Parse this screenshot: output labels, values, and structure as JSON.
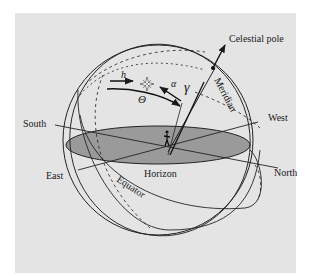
{
  "diagram": {
    "type": "celestial sphere",
    "background_color": "#e4e4e4",
    "horizon_fill": "#9a9a9a",
    "line_color": "#222222",
    "labels": {
      "celestial_pole": "Celestial pole",
      "meridian": "Meridian",
      "south": "South",
      "west": "West",
      "east": "East",
      "north": "North",
      "horizon": "Horizon",
      "equator": "Equator"
    },
    "symbols": {
      "altitude": "h",
      "hour_angle": "Θ",
      "right_ascension": "α",
      "vernal_equinox": "γ"
    },
    "icons": {
      "star": "star-icon",
      "observer": "observer-icon"
    }
  }
}
